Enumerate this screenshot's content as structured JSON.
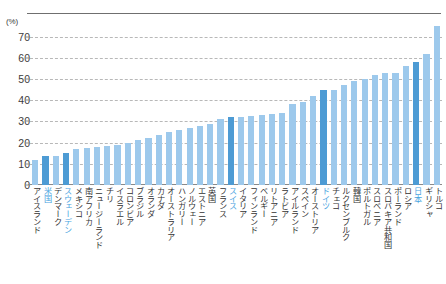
{
  "chart_data": {
    "type": "bar",
    "title": "",
    "subtitle": "",
    "xlabel": "",
    "ylabel": "",
    "unit_label": "(%)",
    "ylim": [
      0,
      75
    ],
    "yticks": [
      0,
      10,
      20,
      30,
      40,
      50,
      60,
      70
    ],
    "grid": true,
    "legend": "none",
    "bar_color": "#9dc9ec",
    "highlight_color": "#4d9bd4",
    "highlight_label_color": "#49a3e0",
    "categories": [
      "アイスランド",
      "米国",
      "デンマーク",
      "スウェーデン",
      "メキシコ",
      "南アフリカ",
      "ニュージーランド",
      "チリ",
      "イスラエル",
      "コロンビア",
      "ブラジル",
      "オランダ",
      "カナダ",
      "オーストラリア",
      "ハンガリー",
      "ノルウェー",
      "エストニア",
      "英国",
      "フランス",
      "スイス",
      "イタリア",
      "フィンランド",
      "ベルギー",
      "リトアニア",
      "ラトビア",
      "アイルランド",
      "スペイン",
      "オーストリア",
      "ドイツ",
      "チェコ",
      "ルクセンブルク",
      "韓国",
      "ポルトガル",
      "スロベニア",
      "スロバキア共和国",
      "ポーランド",
      "ロシア",
      "日本",
      "ギリシャ",
      "トルコ"
    ],
    "values": [
      12,
      13.5,
      13.5,
      15,
      17,
      17.5,
      18,
      18.5,
      19,
      20,
      21,
      22,
      23.5,
      25,
      26,
      27,
      28,
      29,
      31,
      32,
      32,
      32.5,
      33,
      33.5,
      34,
      38,
      39,
      42,
      45,
      45,
      47,
      49,
      50,
      52,
      53,
      53,
      56,
      58,
      62,
      75
    ],
    "highlighted": [
      "米国",
      "スウェーデン",
      "スイス",
      "ドイツ",
      "日本"
    ]
  }
}
